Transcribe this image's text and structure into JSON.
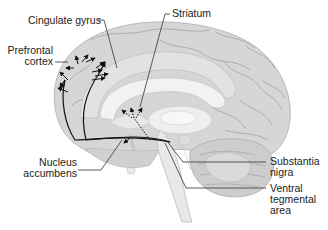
{
  "diagram": {
    "type": "anatomical sagittal brain section",
    "labels": {
      "cingulate_gyrus": "Cingulate gyrus",
      "prefrontal_cortex_line1": "Prefrontal",
      "prefrontal_cortex_line2": "cortex",
      "striatum": "Striatum",
      "nucleus_accumbens_line1": "Nucleus",
      "nucleus_accumbens_line2": "accumbens",
      "substantia_nigra_line1": "Substantia",
      "substantia_nigra_line2": "nigra",
      "vta_line1": "Ventral",
      "vta_line2": "tegmental",
      "vta_line3": "area"
    },
    "colors": {
      "background": "#ffffff",
      "cortex": "#d9d9d9",
      "cortex_dark": "#c4c4c4",
      "sulci": "#a8a8a8",
      "inner": "#ececec",
      "pathway": "#111111",
      "leader": "#333333",
      "text": "#222222"
    }
  }
}
